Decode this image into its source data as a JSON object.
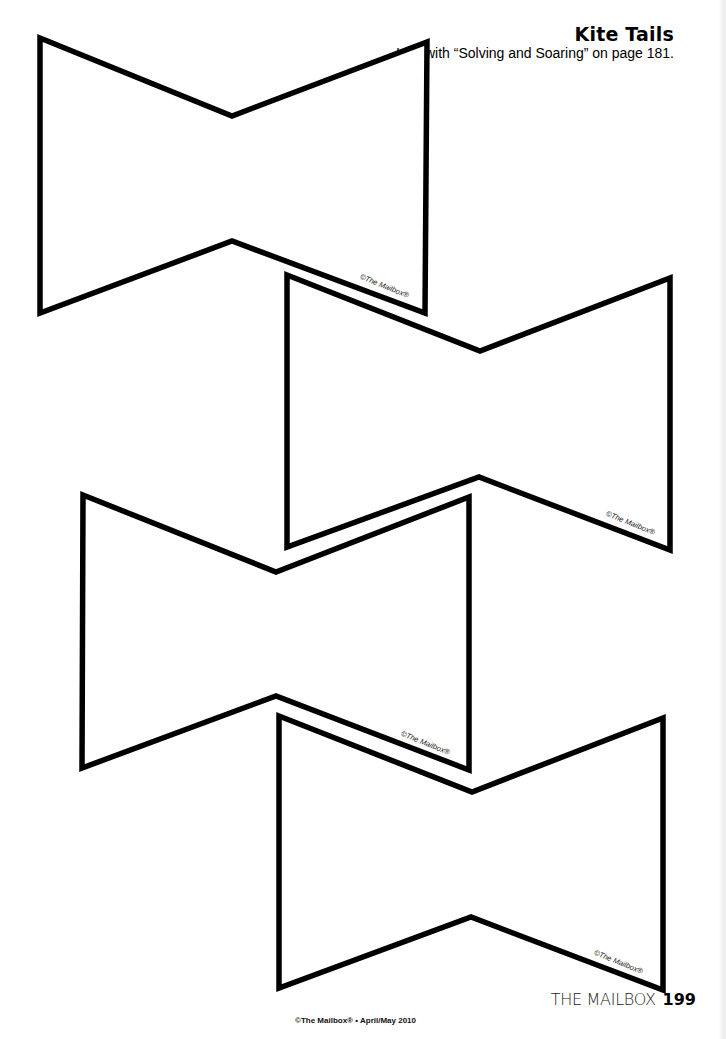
{
  "header": {
    "title": "Kite Tails",
    "subtitle": "Use with “Solving and Soaring” on page 181."
  },
  "shapes": [
    {
      "name": "kite-tail-1",
      "points": "40,38 232,116 427,42 425,313 232,241 40,313",
      "watermark": "©The Mailbox®"
    },
    {
      "name": "kite-tail-2",
      "points": "287,275 480,351 670,278 670,550 479,477 287,547",
      "watermark": "©The Mailbox®"
    },
    {
      "name": "kite-tail-3",
      "points": "83,495 276,572 469,497 469,770 276,696 82,768",
      "watermark": "©The Mailbox®"
    },
    {
      "name": "kite-tail-4",
      "points": "279,716 472,792 663,718 663,990 471,917 279,988",
      "watermark": "©The Mailbox®"
    }
  ],
  "footer": {
    "copyright": "©The Mailbox® • April/May 2010",
    "brand": "THE MAILBOX",
    "page_number": "199"
  },
  "colors": {
    "outline": "#000000",
    "background": "#ffffff"
  }
}
